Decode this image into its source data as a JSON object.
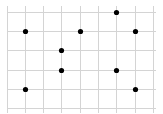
{
  "diagram": {
    "type": "dot-grid",
    "grid": {
      "columns": 8,
      "rows": 5,
      "x_lines": [
        7,
        25,
        43,
        61,
        80,
        98,
        116,
        135,
        153
      ],
      "y_lines": [
        12,
        31,
        50,
        70,
        89,
        108
      ],
      "line_color": "#d4d4d4",
      "line_extend_top": 6,
      "line_extend_bottom": 5,
      "line_extend_left": 0,
      "line_extend_right": 3
    },
    "dot_color": "#000000",
    "dot_radius": 2.6,
    "dots": [
      {
        "col": 6,
        "row": 0
      },
      {
        "col": 1,
        "row": 1
      },
      {
        "col": 4,
        "row": 1
      },
      {
        "col": 7,
        "row": 1
      },
      {
        "col": 3,
        "row": 2
      },
      {
        "col": 3,
        "row": 3
      },
      {
        "col": 6,
        "row": 3
      },
      {
        "col": 1,
        "row": 4
      },
      {
        "col": 7,
        "row": 4
      }
    ]
  }
}
